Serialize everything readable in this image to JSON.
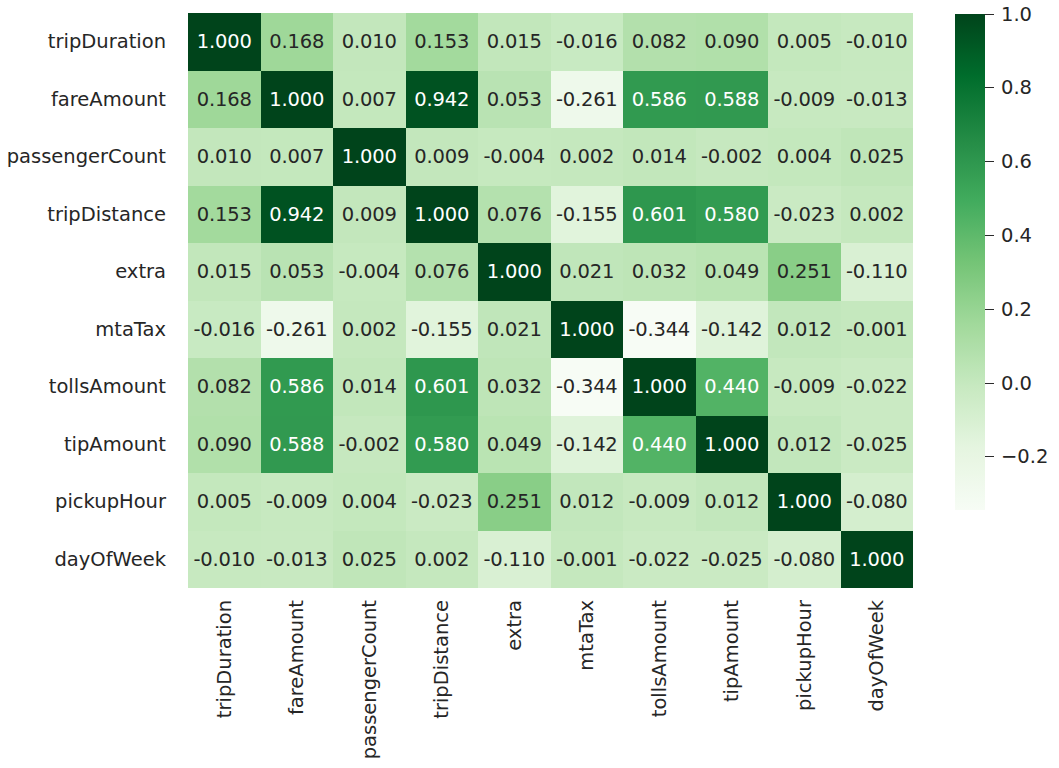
{
  "chart_data": {
    "type": "heatmap",
    "title": "",
    "xlabel": "",
    "ylabel": "",
    "colormap": "Greens",
    "grid": false,
    "legend_position": "right",
    "value_format": "0.000",
    "categories": [
      "tripDuration",
      "fareAmount",
      "passengerCount",
      "tripDistance",
      "extra",
      "mtaTax",
      "tollsAmount",
      "tipAmount",
      "pickupHour",
      "dayOfWeek"
    ],
    "x_tick_labels": [
      "tripDuration",
      "fareAmount",
      "passengerCount",
      "tripDistance",
      "extra",
      "mtaTax",
      "tollsAmount",
      "tipAmount",
      "pickupHour",
      "dayOfWeek"
    ],
    "y_tick_labels": [
      "tripDuration",
      "fareAmount",
      "passengerCount",
      "tripDistance",
      "extra",
      "mtaTax",
      "tollsAmount",
      "tipAmount",
      "pickupHour",
      "dayOfWeek"
    ],
    "x_tick_rotation": 90,
    "values": [
      [
        1.0,
        0.168,
        0.01,
        0.153,
        0.015,
        -0.016,
        0.082,
        0.09,
        0.005,
        -0.01
      ],
      [
        0.168,
        1.0,
        0.007,
        0.942,
        0.053,
        -0.261,
        0.586,
        0.588,
        -0.009,
        -0.013
      ],
      [
        0.01,
        0.007,
        1.0,
        0.009,
        -0.004,
        0.002,
        0.014,
        -0.002,
        0.004,
        0.025
      ],
      [
        0.153,
        0.942,
        0.009,
        1.0,
        0.076,
        -0.155,
        0.601,
        0.58,
        -0.023,
        0.002
      ],
      [
        0.015,
        0.053,
        -0.004,
        0.076,
        1.0,
        0.021,
        0.032,
        0.049,
        0.251,
        -0.11
      ],
      [
        -0.016,
        -0.261,
        0.002,
        -0.155,
        0.021,
        1.0,
        -0.344,
        -0.142,
        0.012,
        -0.001
      ],
      [
        0.082,
        0.586,
        0.014,
        0.601,
        0.032,
        -0.344,
        1.0,
        0.44,
        -0.009,
        -0.022
      ],
      [
        0.09,
        0.588,
        -0.002,
        0.58,
        0.049,
        -0.142,
        0.44,
        1.0,
        0.012,
        -0.025
      ],
      [
        0.005,
        -0.009,
        0.004,
        -0.023,
        0.251,
        0.012,
        -0.009,
        0.012,
        1.0,
        -0.08
      ],
      [
        -0.01,
        -0.013,
        0.025,
        0.002,
        -0.11,
        -0.001,
        -0.022,
        -0.025,
        -0.08,
        1.0
      ]
    ],
    "cell_labels": [
      [
        "1.000",
        "0.168",
        "0.010",
        "0.153",
        "0.015",
        "-0.016",
        "0.082",
        "0.090",
        "0.005",
        "-0.010"
      ],
      [
        "0.168",
        "1.000",
        "0.007",
        "0.942",
        "0.053",
        "-0.261",
        "0.586",
        "0.588",
        "-0.009",
        "-0.013"
      ],
      [
        "0.010",
        "0.007",
        "1.000",
        "0.009",
        "-0.004",
        "0.002",
        "0.014",
        "-0.002",
        "0.004",
        "0.025"
      ],
      [
        "0.153",
        "0.942",
        "0.009",
        "1.000",
        "0.076",
        "-0.155",
        "0.601",
        "0.580",
        "-0.023",
        "0.002"
      ],
      [
        "0.015",
        "0.053",
        "-0.004",
        "0.076",
        "1.000",
        "0.021",
        "0.032",
        "0.049",
        "0.251",
        "-0.110"
      ],
      [
        "-0.016",
        "-0.261",
        "0.002",
        "-0.155",
        "0.021",
        "1.000",
        "-0.344",
        "-0.142",
        "0.012",
        "-0.001"
      ],
      [
        "0.082",
        "0.586",
        "0.014",
        "0.601",
        "0.032",
        "-0.344",
        "1.000",
        "0.440",
        "-0.009",
        "-0.022"
      ],
      [
        "0.090",
        "0.588",
        "-0.002",
        "0.580",
        "0.049",
        "-0.142",
        "0.440",
        "1.000",
        "0.012",
        "-0.025"
      ],
      [
        "0.005",
        "-0.009",
        "0.004",
        "-0.023",
        "0.251",
        "0.012",
        "-0.009",
        "0.012",
        "1.000",
        "-0.080"
      ],
      [
        "-0.010",
        "-0.013",
        "0.025",
        "0.002",
        "-0.110",
        "-0.001",
        "-0.022",
        "-0.025",
        "-0.080",
        "1.000"
      ]
    ],
    "vmin": -0.344,
    "vmax": 1.0,
    "colorbar": {
      "ticks": [
        1.0,
        0.8,
        0.6,
        0.4,
        0.2,
        0.0,
        -0.2
      ],
      "tick_labels": [
        "1.0",
        "0.8",
        "0.6",
        "0.4",
        "0.2",
        "0.0",
        "−0.2"
      ],
      "orientation": "vertical",
      "range": [
        -0.344,
        1.0
      ]
    },
    "colors": {
      "low": "#f7fcf5",
      "mid": "#74c476",
      "high": "#2f3b29",
      "text_dark": "#262626",
      "text_light": "#ffffff",
      "background": "#ffffff"
    }
  }
}
